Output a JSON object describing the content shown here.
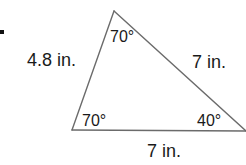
{
  "problem": {
    "marker": "."
  },
  "triangle": {
    "vertices": {
      "top": {
        "x": 114,
        "y": 11
      },
      "bottom_left": {
        "x": 72,
        "y": 130
      },
      "bottom_right": {
        "x": 246,
        "y": 131
      }
    },
    "sides": {
      "left": {
        "label": "4.8 in."
      },
      "right": {
        "label": "7 in."
      },
      "bottom": {
        "label": "7 in."
      }
    },
    "angles": {
      "top": {
        "label": "70°"
      },
      "bottom_left": {
        "label": "70°"
      },
      "bottom_right": {
        "label": "40°"
      }
    },
    "line_color": "#6b6b6b",
    "text_color": "#1a1a1a"
  }
}
